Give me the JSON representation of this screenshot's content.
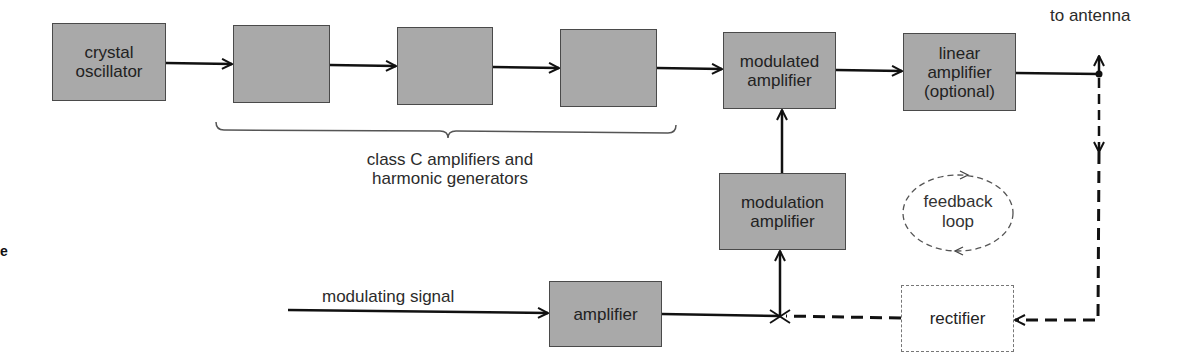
{
  "diagram": {
    "type": "block-diagram",
    "title": "",
    "blocks": {
      "crystal_oscillator": "crystal\noscillator",
      "class_c_1": "",
      "class_c_2": "",
      "class_c_3": "",
      "modulated_amplifier": "modulated\namplifier",
      "linear_amplifier": "linear\namplifier\n(optional)",
      "modulation_amplifier": "modulation\namplifier",
      "amplifier": "amplifier",
      "rectifier": "rectifier"
    },
    "labels": {
      "brace_caption": "class C amplifiers and\nharmonic generators",
      "to_antenna": "to antenna",
      "modulating_signal": "modulating signal",
      "feedback_loop": "feedback\nloop",
      "stray_letter": "e"
    },
    "colors": {
      "block_fill": "#a9a9a9",
      "block_border": "#4a4a4a",
      "line": "#111111",
      "background": "#ffffff"
    },
    "connections": [
      {
        "from": "crystal_oscillator",
        "to": "class_c_1",
        "style": "solid"
      },
      {
        "from": "class_c_1",
        "to": "class_c_2",
        "style": "solid"
      },
      {
        "from": "class_c_2",
        "to": "class_c_3",
        "style": "solid"
      },
      {
        "from": "class_c_3",
        "to": "modulated_amplifier",
        "style": "solid"
      },
      {
        "from": "modulated_amplifier",
        "to": "linear_amplifier",
        "style": "solid"
      },
      {
        "from": "linear_amplifier",
        "to": "to_antenna",
        "style": "solid"
      },
      {
        "from": "antenna_junction",
        "to": "rectifier",
        "style": "dashed"
      },
      {
        "from": "rectifier",
        "to": "summing_junction",
        "style": "dashed"
      },
      {
        "from": "modulating_signal",
        "to": "amplifier",
        "style": "solid"
      },
      {
        "from": "amplifier",
        "to": "summing_junction",
        "style": "solid"
      },
      {
        "from": "summing_junction",
        "to": "modulation_amplifier",
        "style": "solid"
      },
      {
        "from": "modulation_amplifier",
        "to": "modulated_amplifier",
        "style": "solid"
      }
    ]
  }
}
